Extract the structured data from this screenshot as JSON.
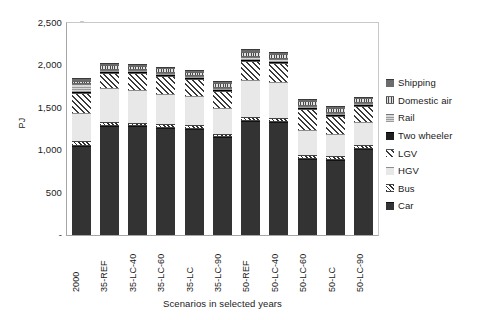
{
  "chart_data": {
    "type": "bar",
    "stacked": true,
    "title": "",
    "xlabel": "Scenarios in selected years",
    "ylabel": "PJ",
    "ylim": [
      0,
      2500
    ],
    "ytick_values": [
      0,
      500,
      1000,
      1500,
      2000,
      2500
    ],
    "ytick_labels": [
      "-",
      "500",
      "1,000",
      "1,500",
      "2,000",
      "2,500"
    ],
    "grid": false,
    "legend_position": "right",
    "categories": [
      "2000",
      "35-REF",
      "35-LC-40",
      "35-LC-60",
      "35-LC",
      "35-LC-90",
      "50-REF",
      "50-LC-40",
      "50-LC-60",
      "50-LC",
      "50-LC-90"
    ],
    "series": [
      {
        "name": "Car",
        "key": "car",
        "values": [
          1050,
          1290,
          1285,
          1265,
          1255,
          1150,
          1345,
          1335,
          900,
          890,
          1020
        ]
      },
      {
        "name": "Bus",
        "key": "bus",
        "values": [
          55,
          40,
          40,
          40,
          40,
          40,
          45,
          45,
          40,
          40,
          40
        ]
      },
      {
        "name": "HGV",
        "key": "hgv",
        "values": [
          330,
          400,
          390,
          360,
          340,
          305,
          435,
          420,
          300,
          260,
          275
        ]
      },
      {
        "name": "LGV",
        "key": "lgv",
        "values": [
          240,
          185,
          190,
          210,
          200,
          205,
          230,
          225,
          250,
          215,
          185
        ]
      },
      {
        "name": "Two wheeler",
        "key": "twowheeler",
        "values": [
          10,
          10,
          10,
          10,
          10,
          10,
          12,
          12,
          10,
          10,
          10
        ]
      },
      {
        "name": "Rail",
        "key": "rail",
        "values": [
          90,
          25,
          25,
          25,
          25,
          25,
          35,
          35,
          25,
          25,
          25
        ]
      },
      {
        "name": "Domestic air",
        "key": "domair",
        "values": [
          45,
          55,
          55,
          55,
          55,
          55,
          60,
          60,
          55,
          55,
          55
        ]
      },
      {
        "name": "Shipping",
        "key": "shipping",
        "values": [
          32,
          20,
          20,
          20,
          20,
          20,
          28,
          28,
          20,
          20,
          20
        ]
      }
    ],
    "totals": [
      1852,
      2025,
      2015,
      1985,
      1925,
      1810,
      2190,
      2160,
      1600,
      1515,
      1630
    ]
  },
  "legend": {
    "items": [
      {
        "label": "Shipping",
        "key": "shipping",
        "swatch": "solid-gray"
      },
      {
        "label": "Domestic air",
        "key": "domair",
        "swatch": "vertical-stripe"
      },
      {
        "label": "Rail",
        "key": "rail",
        "swatch": "horizontal-stripe"
      },
      {
        "label": "Two wheeler",
        "key": "twowheeler",
        "swatch": "solid-black"
      },
      {
        "label": "LGV",
        "key": "lgv",
        "swatch": "diagonal-hatch-wide"
      },
      {
        "label": "HGV",
        "key": "hgv",
        "swatch": "light-fill"
      },
      {
        "label": "Bus",
        "key": "bus",
        "swatch": "diagonal-hatch-fine"
      },
      {
        "label": "Car",
        "key": "car",
        "swatch": "solid-dark"
      }
    ]
  },
  "colors": {
    "car": "#333333",
    "bus": "#2e2e2e",
    "hgv": "#e8e8e8",
    "lgv": "#3a3a3a",
    "twowheeler": "#1f1f1f",
    "rail": "#9a9a9a",
    "domair": "#4a4a4a",
    "shipping": "#6b6b6b",
    "axis": "#a6a6a6",
    "text": "#1a1a1a"
  }
}
